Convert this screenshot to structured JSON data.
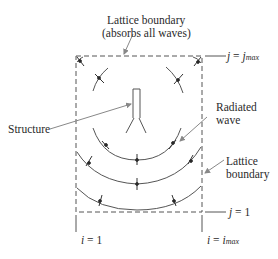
{
  "diagram": {
    "type": "fdtd-lattice-schematic",
    "labels": {
      "top_boundary_line1": "Lattice boundary",
      "top_boundary_line2": "(absorbs all waves)",
      "j_max": {
        "var": "j",
        "eq": " = ",
        "base": "j",
        "sub": "max"
      },
      "structure": "Structure",
      "radiated_wave_line1": "Radiated",
      "radiated_wave_line2": "wave",
      "right_boundary_line1": "Lattice",
      "right_boundary_line2": "boundary",
      "j_one": {
        "var": "j",
        "eq": " = 1"
      },
      "i_one": {
        "var": "i",
        "eq": " = 1"
      },
      "i_max": {
        "var": "i",
        "eq": " = ",
        "base": "i",
        "sub": "max"
      }
    },
    "colors": {
      "line": "#444444",
      "arrow": "#888888",
      "text": "#2a2a2a",
      "background": "#ffffff"
    }
  }
}
